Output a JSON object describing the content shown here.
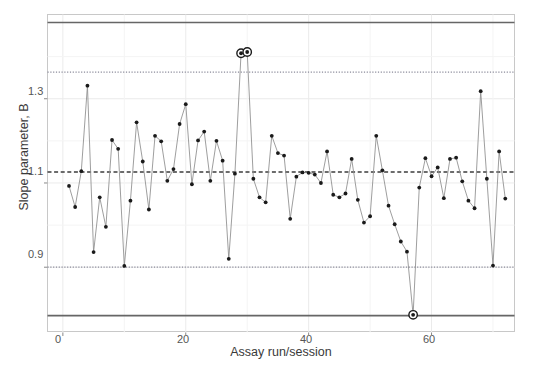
{
  "chart_data": {
    "type": "line",
    "title": "",
    "subtitle": "",
    "xlabel": "Assay run/session",
    "ylabel": "Slope parameter, B",
    "xticks": [
      0,
      20,
      40,
      60
    ],
    "yticks": [
      0.9,
      1.1,
      1.3
    ],
    "xlim": [
      -2.5,
      73.5
    ],
    "ylim": [
      0.745,
      1.5
    ],
    "grid": true,
    "legend": null,
    "series": [
      {
        "name": "Slope parameter B per assay run",
        "marker": "filled-circle",
        "color": "#1a1a1a",
        "line_color": "#8c8c8c",
        "x": [
          1,
          2,
          3,
          4,
          5,
          6,
          7,
          8,
          9,
          10,
          11,
          12,
          13,
          14,
          15,
          16,
          17,
          18,
          19,
          20,
          21,
          22,
          23,
          24,
          25,
          26,
          27,
          28,
          29,
          30,
          31,
          32,
          33,
          34,
          35,
          36,
          37,
          38,
          39,
          40,
          41,
          42,
          43,
          44,
          45,
          46,
          47,
          48,
          49,
          50,
          51,
          52,
          53,
          54,
          55,
          56,
          57,
          58,
          59,
          60,
          61,
          62,
          63,
          64,
          65,
          66,
          67,
          68,
          69,
          70,
          71,
          72
        ],
        "y": [
          1.093,
          1.043,
          1.128,
          1.331,
          0.936,
          1.066,
          0.996,
          1.202,
          1.181,
          0.903,
          1.058,
          1.244,
          1.151,
          1.037,
          1.212,
          1.199,
          1.105,
          1.133,
          1.24,
          1.287,
          1.097,
          1.201,
          1.222,
          1.105,
          1.2,
          1.153,
          0.92,
          1.122,
          1.408,
          1.411,
          1.11,
          1.066,
          1.054,
          1.212,
          1.171,
          1.165,
          1.015,
          1.115,
          1.125,
          1.124,
          1.12,
          1.1,
          1.175,
          1.072,
          1.066,
          1.075,
          1.157,
          1.06,
          1.006,
          1.021,
          1.212,
          1.13,
          1.046,
          1.002,
          0.961,
          0.937,
          0.787,
          1.089,
          1.159,
          1.116,
          1.137,
          1.064,
          1.157,
          1.16,
          1.104,
          1.058,
          1.04,
          1.318,
          1.11,
          0.904,
          1.175,
          1.063
        ]
      }
    ],
    "flagged_points": [
      {
        "x": 29,
        "y": 1.408,
        "reason": "above upper control limit"
      },
      {
        "x": 30,
        "y": 1.411,
        "reason": "above upper control limit"
      },
      {
        "x": 57,
        "y": 0.787,
        "reason": "below lower control limit"
      }
    ],
    "reference_lines": [
      {
        "name": "upper-control-limit",
        "value": 1.481,
        "style": "solid",
        "color": "#666666"
      },
      {
        "name": "upper-warning-limit",
        "value": 1.363,
        "style": "dotted",
        "color": "#8a8a9a"
      },
      {
        "name": "center-line",
        "value": 1.126,
        "style": "dashed",
        "color": "#3c3c3c"
      },
      {
        "name": "lower-warning-limit",
        "value": 0.9,
        "style": "dotted",
        "color": "#8a8a9a"
      },
      {
        "name": "lower-control-limit",
        "value": 0.785,
        "style": "solid",
        "color": "#666666"
      }
    ]
  },
  "axis": {
    "y_title": "Slope parameter, B",
    "x_title": "Assay run/session",
    "y_tick_labels": [
      "1.3",
      "1.1",
      "0.9"
    ],
    "x_tick_labels": [
      "0",
      "20",
      "40",
      "60"
    ]
  },
  "colors": {
    "panel_background": "#ffffff",
    "panel_border": "#c8c8c8",
    "gridline_major": "#ebebeb",
    "point_fill": "#1a1a1a",
    "line_stroke": "#8c8c8c",
    "control_limit": "#666666",
    "warning_limit": "#8a8a9a",
    "center_line": "#3c3c3c"
  }
}
